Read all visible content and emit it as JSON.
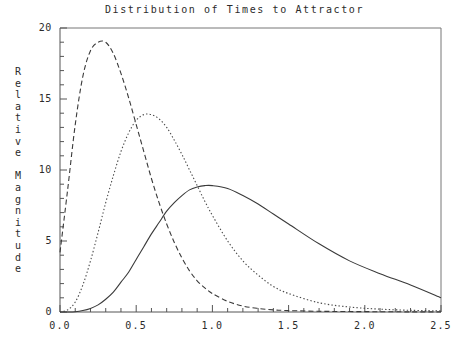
{
  "chart_data": {
    "type": "line",
    "title": "Distribution of Times to Attractor",
    "xlabel": "Time to Attractor",
    "ylabel": "Relative Magnitude",
    "xlim": [
      0.0,
      2.5
    ],
    "ylim": [
      0,
      20
    ],
    "grid": false,
    "legend": "none",
    "xticks": [
      "0.0",
      "0.5",
      "1.0",
      "1.5",
      "2.0",
      "2.5"
    ],
    "xtick_values": [
      0.0,
      0.5,
      1.0,
      1.5,
      2.0,
      2.5
    ],
    "x_minor_tick_step": 0.1,
    "yticks": [
      "0",
      "5",
      "10",
      "15",
      "20"
    ],
    "ytick_values": [
      0,
      5,
      10,
      15,
      20
    ],
    "y_minor_tick_step": 1,
    "series": [
      {
        "name": "dashed-distribution",
        "style": "dashed",
        "color": "#3a3a3a",
        "peak_x": 0.3,
        "peak_y": 19.0,
        "x": [
          0.0,
          0.05,
          0.1,
          0.15,
          0.2,
          0.25,
          0.3,
          0.35,
          0.4,
          0.45,
          0.5,
          0.55,
          0.6,
          0.65,
          0.7,
          0.75,
          0.8,
          0.85,
          0.9,
          0.95,
          1.0,
          1.1,
          1.2,
          1.3,
          1.4,
          1.5,
          1.7,
          1.9,
          2.1,
          2.3,
          2.5
        ],
        "values": [
          4.2,
          8.6,
          13.2,
          16.6,
          18.4,
          19.0,
          19.0,
          18.2,
          16.8,
          15.1,
          13.2,
          11.3,
          9.4,
          7.7,
          6.2,
          4.9,
          3.8,
          2.9,
          2.2,
          1.7,
          1.3,
          0.75,
          0.42,
          0.25,
          0.15,
          0.1,
          0.05,
          0.03,
          0.02,
          0.01,
          0.01
        ]
      },
      {
        "name": "dotted-distribution",
        "style": "dotted",
        "color": "#4a4a4a",
        "peak_x": 0.6,
        "peak_y": 13.9,
        "x": [
          0.0,
          0.05,
          0.1,
          0.15,
          0.2,
          0.25,
          0.3,
          0.35,
          0.4,
          0.45,
          0.5,
          0.55,
          0.6,
          0.65,
          0.7,
          0.75,
          0.8,
          0.85,
          0.9,
          0.95,
          1.0,
          1.1,
          1.2,
          1.3,
          1.4,
          1.5,
          1.7,
          1.9,
          2.1,
          2.3,
          2.5
        ],
        "values": [
          0.0,
          0.15,
          0.7,
          1.9,
          3.6,
          5.6,
          7.7,
          9.6,
          11.3,
          12.6,
          13.5,
          13.9,
          13.9,
          13.6,
          13.0,
          12.1,
          11.1,
          10.0,
          8.9,
          7.8,
          6.8,
          5.0,
          3.6,
          2.6,
          1.8,
          1.3,
          0.65,
          0.35,
          0.2,
          0.12,
          0.08
        ]
      },
      {
        "name": "solid-distribution",
        "style": "solid",
        "color": "#3a3a3a",
        "peak_x": 1.02,
        "peak_y": 8.9,
        "x": [
          0.0,
          0.05,
          0.1,
          0.15,
          0.2,
          0.25,
          0.3,
          0.35,
          0.4,
          0.45,
          0.5,
          0.55,
          0.6,
          0.65,
          0.7,
          0.75,
          0.8,
          0.85,
          0.9,
          0.95,
          1.0,
          1.1,
          1.2,
          1.3,
          1.4,
          1.5,
          1.7,
          1.9,
          2.1,
          2.3,
          2.5
        ],
        "values": [
          0.0,
          0.0,
          0.02,
          0.1,
          0.25,
          0.5,
          0.9,
          1.4,
          2.1,
          2.8,
          3.7,
          4.6,
          5.5,
          6.3,
          7.1,
          7.7,
          8.2,
          8.6,
          8.8,
          8.9,
          8.9,
          8.7,
          8.2,
          7.6,
          6.9,
          6.2,
          4.8,
          3.6,
          2.7,
          1.9,
          1.0
        ]
      }
    ]
  },
  "axes": {
    "y_title_chars": [
      "R",
      "e",
      "l",
      "a",
      "t",
      "i",
      "v",
      "e",
      "",
      "M",
      "a",
      "g",
      "n",
      "i",
      "t",
      "u",
      "d",
      "e"
    ]
  }
}
